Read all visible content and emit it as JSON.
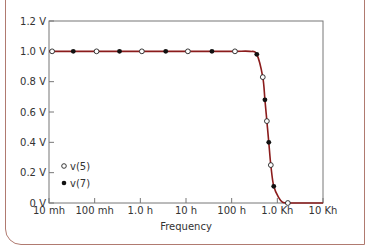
{
  "chart_data": {
    "type": "line",
    "title": "",
    "xlabel": "Frequency",
    "ylabel": "",
    "xscale": "log",
    "xlim": [
      0.01,
      10000
    ],
    "ylim": [
      0,
      1.2
    ],
    "x_tick_labels": [
      "10 mh",
      "100 mh",
      "1.0 h",
      "10 h",
      "100 h",
      "1.0 Kh",
      "10 Kh"
    ],
    "x_tick_values": [
      0.01,
      0.1,
      1,
      10,
      100,
      1000,
      10000
    ],
    "y_tick_labels": [
      "0 V",
      "0.2 V",
      "0.4 V",
      "0.6 V",
      "0.8 V",
      "1.0 V",
      "1.2 V"
    ],
    "y_tick_values": [
      0,
      0.2,
      0.4,
      0.6,
      0.8,
      1.0,
      1.2
    ],
    "grid": false,
    "legend_position": "lower-left",
    "curve_color": "#8b1c1c",
    "series": [
      {
        "name": "v(5)",
        "marker": "open-circle",
        "x": [
          0.0117,
          0.11,
          1.08,
          11,
          118,
          480,
          590,
          720,
          1700
        ],
        "values": [
          1.0,
          1.0,
          1.0,
          1.0,
          1.0,
          0.83,
          0.54,
          0.25,
          0.0
        ]
      },
      {
        "name": "v(7)",
        "marker": "filled-circle",
        "x": [
          0.034,
          0.35,
          3.6,
          37,
          355,
          535,
          650,
          835
        ],
        "values": [
          1.0,
          1.0,
          1.0,
          1.0,
          0.98,
          0.68,
          0.4,
          0.11
        ]
      }
    ]
  }
}
